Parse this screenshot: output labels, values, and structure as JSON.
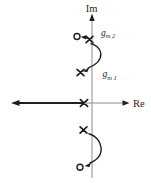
{
  "diagram": {
    "kind": "pole-zero root-locus sketch in complex s-plane",
    "axis_labels": {
      "vertical": "Im",
      "horizontal": "Re"
    },
    "annotations": {
      "gm2": {
        "base": "g",
        "sub": "m 2"
      },
      "gm1": {
        "base": "g",
        "sub": "m 1"
      }
    },
    "markers": [
      {
        "symbol": "o",
        "meaning": "zero",
        "location": "upper imaginary axis, left of axis"
      },
      {
        "symbol": "x",
        "meaning": "pole",
        "location": "upper imaginary axis, beside label gm2"
      },
      {
        "symbol": "x",
        "meaning": "pole",
        "location": "upper imaginary axis, beside label gm1"
      },
      {
        "symbol": "x",
        "meaning": "pole",
        "location": "negative real axis near origin"
      },
      {
        "symbol": "x",
        "meaning": "pole",
        "location": "lower imaginary axis"
      },
      {
        "symbol": "o",
        "meaning": "zero",
        "location": "lower imaginary axis, left of axis"
      }
    ],
    "arrows": [
      "long arrow from real-axis pole pointing toward negative infinity",
      "short arrow from upper pole pointing into upper zero",
      "curved arc between gm2 pole and gm1 pole with arrowhead at lower end",
      "curved arc from lower pole with arrowhead pointing into lower zero"
    ],
    "colors": {
      "ink": "#1f1f1f",
      "axis": "#8c8c8c",
      "background": "#ffffff"
    }
  }
}
